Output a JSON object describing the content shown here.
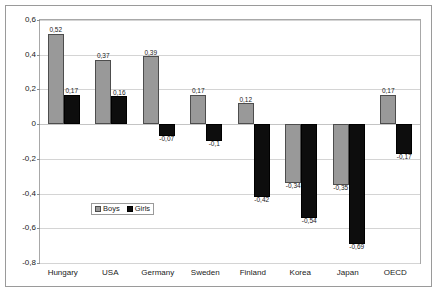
{
  "chart_data": {
    "type": "bar",
    "title": "",
    "xlabel": "",
    "ylabel": "",
    "ylim": [
      -0.8,
      0.6
    ],
    "ytick_step": 0.2,
    "grid": true,
    "legend_position": "inside-bottom-left",
    "decimal_separator": ",",
    "categories": [
      "Hungary",
      "USA",
      "Germany",
      "Sweden",
      "Finland",
      "Korea",
      "Japan",
      "OECD"
    ],
    "yticks": [
      {
        "value": 0.6,
        "label": "0,6"
      },
      {
        "value": 0.4,
        "label": "0,4"
      },
      {
        "value": 0.2,
        "label": "0,2"
      },
      {
        "value": 0.0,
        "label": "0"
      },
      {
        "value": -0.2,
        "label": "-0,2"
      },
      {
        "value": -0.4,
        "label": "-0,4"
      },
      {
        "value": -0.6,
        "label": "-0,6"
      },
      {
        "value": -0.8,
        "label": "-0,8"
      }
    ],
    "series": [
      {
        "name": "Boys",
        "color": "#999999",
        "values": [
          0.52,
          0.37,
          0.39,
          0.17,
          0.12,
          -0.34,
          -0.35,
          0.17
        ],
        "labels": [
          "0,52",
          "0,37",
          "0,39",
          "0,17",
          "0,12",
          "-0,34",
          "-0,35",
          "0,17"
        ]
      },
      {
        "name": "Girls",
        "color": "#0d0d0d",
        "values": [
          0.17,
          0.16,
          -0.07,
          -0.1,
          -0.42,
          -0.54,
          -0.69,
          -0.17
        ],
        "labels": [
          "0,17",
          "0,16",
          "-0,07",
          "-0,1",
          "-0,42",
          "-0,54",
          "-0,69",
          "-0,17"
        ]
      }
    ]
  },
  "legend": {
    "items": [
      {
        "label": "Boys",
        "key": "boys"
      },
      {
        "label": "Girls",
        "key": "girls"
      }
    ]
  }
}
